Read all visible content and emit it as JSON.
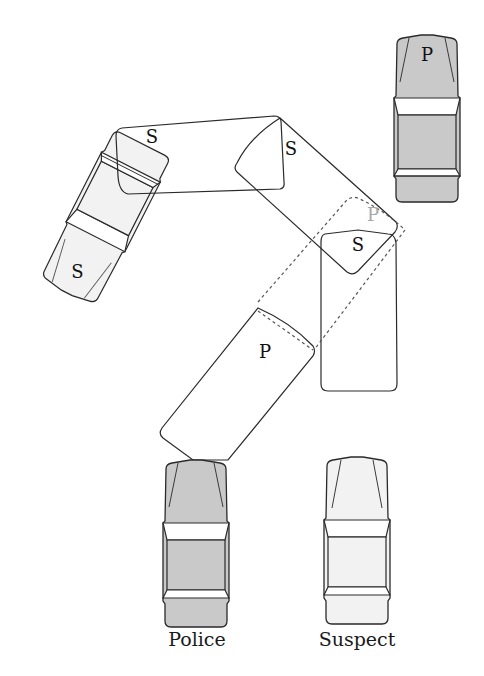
{
  "diagram": {
    "colors": {
      "police_fill": "#c9c9c9",
      "suspect_fill": "#f2f2f2",
      "outline": "#2a2a2a",
      "ghost_label": "#a8a8a8",
      "background": "#ffffff"
    },
    "legend": {
      "police_label": "Police",
      "suspect_label": "Suspect"
    },
    "vehicles": [
      {
        "id": "parked-police",
        "label": "P",
        "kind": "police",
        "style": "filled"
      },
      {
        "id": "suspect-spun",
        "label": "S",
        "kind": "suspect",
        "style": "detailed-light"
      },
      {
        "id": "suspect-path-1",
        "label": "S",
        "kind": "suspect",
        "style": "outline"
      },
      {
        "id": "suspect-path-2",
        "label": "S",
        "kind": "suspect",
        "style": "outline"
      },
      {
        "id": "suspect-path-3",
        "label": "S",
        "kind": "suspect",
        "style": "outline"
      },
      {
        "id": "police-path-1",
        "label": "P",
        "kind": "police",
        "style": "outline"
      },
      {
        "id": "police-path-ghost",
        "label": "P",
        "kind": "police",
        "style": "dashed"
      }
    ],
    "labels": {
      "parked_p": "P",
      "spun_s": "S",
      "path_s_top": "S",
      "path_s_diag": "S",
      "path_s_right": "S",
      "path_p": "P",
      "ghost_p": "P"
    }
  }
}
